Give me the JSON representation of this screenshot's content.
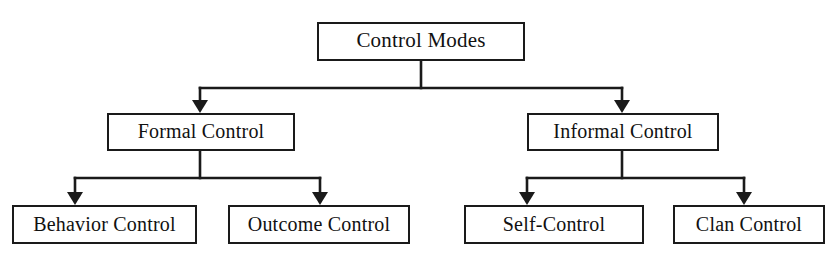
{
  "diagram": {
    "title": "Control Modes",
    "type": "hierarchy-tree",
    "colors": {
      "background": "#ffffff",
      "line": "#1a1a1a",
      "box_border": "#1a1a1a",
      "text": "#111111"
    },
    "root": {
      "label": "Control Modes"
    },
    "level2": [
      {
        "label": "Formal Control"
      },
      {
        "label": "Informal Control"
      }
    ],
    "level3": [
      {
        "label": "Behavior Control"
      },
      {
        "label": "Outcome Control"
      },
      {
        "label": "Self-Control"
      },
      {
        "label": "Clan Control"
      }
    ]
  }
}
